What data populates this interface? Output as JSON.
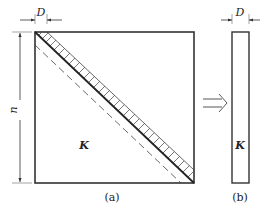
{
  "figure": {
    "panel_a": {
      "caption": "(a)",
      "matrix_label": "K",
      "width_dim_label": "D",
      "height_dim_label": "n"
    },
    "panel_b": {
      "caption": "(b)",
      "matrix_label": "K",
      "width_dim_label": "D"
    },
    "arrow": "double-right-arrow",
    "colors": {
      "line": "#333333",
      "hatch": "#555555",
      "background": "#ffffff"
    }
  }
}
